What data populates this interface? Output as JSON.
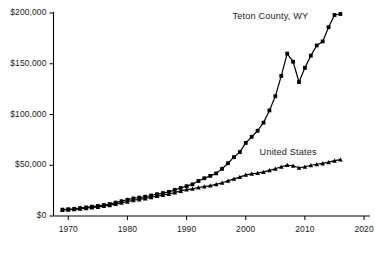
{
  "chart_data": {
    "type": "line",
    "title": "",
    "subtitle": "",
    "xlabel": "",
    "ylabel": "",
    "xlim": [
      1967.5,
      2021
    ],
    "ylim": [
      0,
      200000
    ],
    "grid": false,
    "legend_position": "inline-labels",
    "x_ticks": [
      "1970",
      "1980",
      "1990",
      "2000",
      "2010",
      "2020"
    ],
    "x_tick_values": [
      1970,
      1980,
      1990,
      2000,
      2010,
      2020
    ],
    "y_ticks": [
      "$0",
      "$50,000",
      "$100,000",
      "$150,000",
      "$200,000"
    ],
    "y_tick_values": [
      0,
      50000,
      100000,
      150000,
      200000
    ],
    "x": [
      1969,
      1970,
      1971,
      1972,
      1973,
      1974,
      1975,
      1976,
      1977,
      1978,
      1979,
      1980,
      1981,
      1982,
      1983,
      1984,
      1985,
      1986,
      1987,
      1988,
      1989,
      1990,
      1991,
      1992,
      1993,
      1994,
      1995,
      1996,
      1997,
      1998,
      1999,
      2000,
      2001,
      2002,
      2003,
      2004,
      2005,
      2006,
      2007,
      2008,
      2009,
      2010,
      2011,
      2012,
      2013,
      2014,
      2015,
      2016
    ],
    "series": [
      {
        "name": "Teton County, WY",
        "marker": "square",
        "color": "#000000",
        "values": [
          6300,
          6700,
          7100,
          7800,
          8500,
          9200,
          9900,
          10800,
          11800,
          13200,
          14600,
          16000,
          17300,
          18200,
          19000,
          20200,
          21500,
          22600,
          23800,
          25800,
          27600,
          29400,
          31200,
          34500,
          37200,
          39500,
          42000,
          46500,
          52000,
          58000,
          63000,
          72000,
          78000,
          84000,
          92000,
          104000,
          118000,
          138000,
          160000,
          152000,
          132000,
          146000,
          158000,
          168000,
          172000,
          186000,
          198000,
          199000
        ]
      },
      {
        "name": "United States",
        "marker": "triangle",
        "color": "#000000",
        "values": [
          5900,
          6200,
          6500,
          7000,
          7700,
          8300,
          8900,
          9700,
          10600,
          11700,
          12900,
          14100,
          15500,
          16300,
          17300,
          18500,
          19600,
          20600,
          21700,
          23100,
          24700,
          26000,
          26800,
          28100,
          29000,
          30000,
          31200,
          32800,
          34600,
          36600,
          38300,
          40500,
          41500,
          42200,
          43400,
          45000,
          46500,
          48500,
          50200,
          49500,
          47500,
          48500,
          50000,
          51000,
          51800,
          53000,
          54500,
          55500
        ]
      }
    ],
    "annotations": [
      {
        "text": "Teton County, WY",
        "x": 2004,
        "y": 196000
      },
      {
        "text": "United States",
        "x": 2007,
        "y": 62000
      }
    ]
  }
}
